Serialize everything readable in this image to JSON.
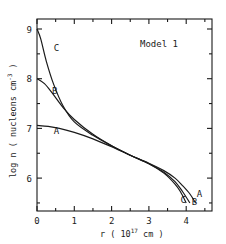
{
  "chart_data": {
    "type": "line",
    "title": "Model 1",
    "xlabel": "r (10^17 cm)",
    "ylabel": "log n (nucleons cm^-3)",
    "xlim": [
      0,
      4.7
    ],
    "ylim": [
      5.35,
      9.2
    ],
    "grid": false,
    "legend": "inline curve labels A, B, C",
    "x_ticks": [
      0,
      1,
      2,
      3,
      4
    ],
    "x_tick_labels": [
      "0",
      "1",
      "2",
      "3",
      "4"
    ],
    "x_minor_ticks": [
      0.5,
      1.5,
      2.5,
      3.5,
      4.5
    ],
    "y_ticks": [
      6,
      7,
      8,
      9
    ],
    "y_tick_labels": [
      "6",
      "7",
      "8",
      "9"
    ],
    "y_minor_ticks": [
      5.5,
      6.5,
      7.5,
      8.5
    ],
    "series": [
      {
        "name": "A",
        "x": [
          0,
          0.3,
          0.6,
          1.0,
          1.5,
          2.0,
          2.5,
          3.0,
          3.4,
          3.7,
          3.9,
          4.1,
          4.25
        ],
        "y": [
          7.06,
          7.04,
          7.0,
          6.92,
          6.79,
          6.63,
          6.46,
          6.3,
          6.15,
          6.0,
          5.85,
          5.68,
          5.5
        ]
      },
      {
        "name": "B",
        "x": [
          0,
          0.2,
          0.4,
          0.7,
          1.0,
          1.5,
          2.0,
          2.5,
          3.0,
          3.4,
          3.7,
          3.9,
          4.1
        ],
        "y": [
          8.0,
          7.9,
          7.72,
          7.42,
          7.18,
          6.88,
          6.65,
          6.46,
          6.29,
          6.12,
          5.93,
          5.73,
          5.5
        ]
      },
      {
        "name": "C",
        "x": [
          0,
          0.1,
          0.25,
          0.45,
          0.7,
          1.0,
          1.5,
          2.0,
          2.5,
          3.0,
          3.4,
          3.7,
          3.85,
          4.0
        ],
        "y": [
          9.0,
          8.8,
          8.35,
          7.88,
          7.45,
          7.13,
          6.86,
          6.65,
          6.46,
          6.29,
          6.1,
          5.88,
          5.72,
          5.5
        ]
      }
    ],
    "annotations": [
      {
        "text": "Model 1",
        "x": 2.6,
        "y": 8.6
      },
      {
        "text": "C",
        "x": 0.45,
        "y": 8.55
      },
      {
        "text": "B",
        "x": 0.4,
        "y": 7.7
      },
      {
        "text": "A",
        "x": 0.45,
        "y": 6.88
      },
      {
        "text": "A",
        "x": 4.28,
        "y": 5.62
      },
      {
        "text": "B",
        "x": 4.15,
        "y": 5.45
      },
      {
        "text": "C",
        "x": 3.85,
        "y": 5.5
      }
    ]
  },
  "labels": {
    "model": "Model 1",
    "xlabel_main": "r ( 10",
    "xlabel_exp": "17",
    "xlabel_unit": " cm )",
    "ylabel": "log n ( nucleons  cm",
    "ylabel_exp": "-3",
    "ylabel_close": " )"
  }
}
